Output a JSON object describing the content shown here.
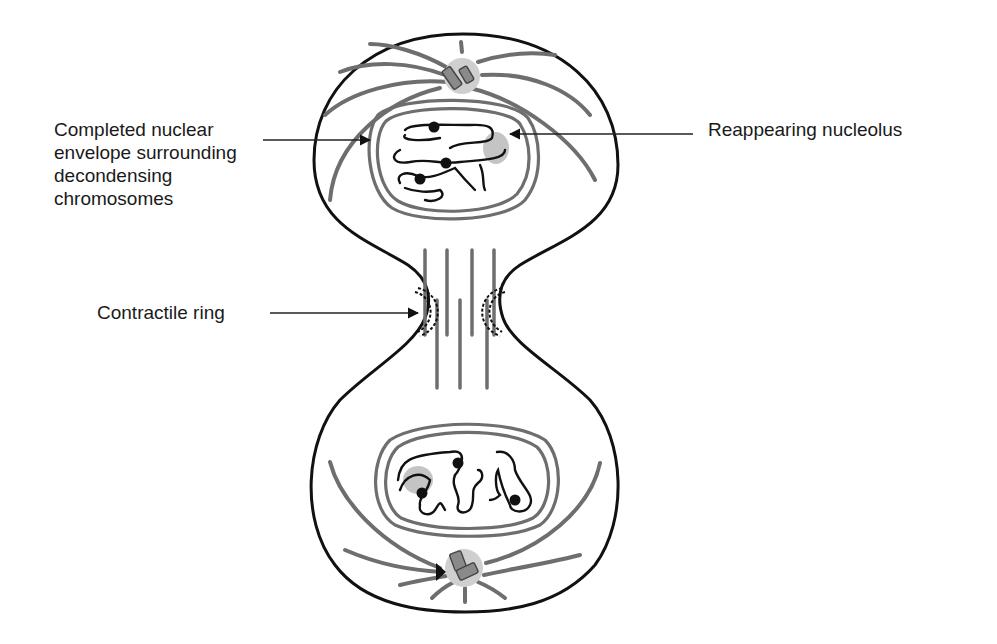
{
  "figure": {
    "type": "telophase-cytokinesis-diagram",
    "labels": {
      "nuclear_envelope": [
        "Completed nuclear",
        "envelope surrounding",
        "decondensing",
        "chromosomes"
      ],
      "nucleolus": "Reappearing nucleolus",
      "contractile_ring": "Contractile ring"
    },
    "colors": {
      "outline": "#111111",
      "microtubule": "#6e6e6e",
      "centrosome_halo": "#c8c8c8",
      "centriole": "#8a8a8a",
      "nucleolus": "#c4c4c4"
    }
  }
}
